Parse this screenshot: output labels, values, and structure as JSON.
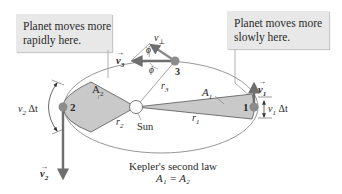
{
  "callouts": {
    "left": {
      "lines": [
        "Planet moves more",
        "rapidly here."
      ]
    },
    "right": {
      "lines": [
        "Planet moves more",
        "slowly here."
      ]
    }
  },
  "labels": {
    "sun": "Sun",
    "planet_1": "1",
    "planet_2": "2",
    "planet_3": "3",
    "area_1": "A",
    "area_1_sub": "1",
    "area_2": "A",
    "area_2_sub": "2",
    "r1": "r",
    "r1_sub": "1",
    "r2": "r",
    "r2_sub": "2",
    "r3": "r",
    "r3_sub": "3",
    "v1_vec": "v",
    "v1_sub": "1",
    "v2_vec": "v",
    "v2_sub": "2",
    "v3_vec": "v",
    "v3_sub": "3",
    "v_perp": "v",
    "v_perp_sub": "⊥",
    "phi_upper": "ϕ",
    "phi_lower": "ϕ",
    "v1_dt": "v",
    "v1_dt_sub": "1",
    "v1_dt_suffix": " Δt",
    "v2_dt": "v",
    "v2_dt_sub": "2",
    "v2_dt_suffix": " Δt"
  },
  "caption": {
    "title": "Kepler's second law",
    "equation": "A₁ = A₂"
  },
  "colors": {
    "callout_bg": "#e8e8e8",
    "wedge_fill": "#c9c9c9",
    "arrow": "#6e6e6e",
    "orbit": "#8a8a8a",
    "planet": "#8c8c8c",
    "sun_fill": "#ffffff"
  }
}
